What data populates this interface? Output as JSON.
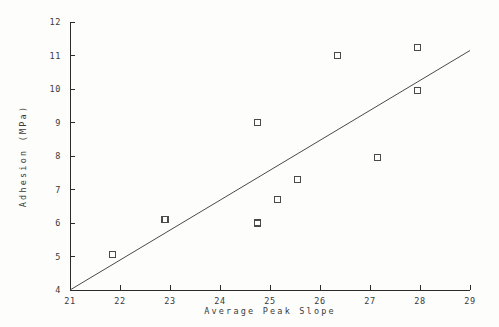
{
  "chart_data": {
    "type": "scatter",
    "title": "",
    "xlabel": "Average Peak Slope",
    "ylabel": "Adhesion (MPa)",
    "xlim": [
      21,
      29
    ],
    "ylim": [
      4,
      12
    ],
    "xticks": [
      21,
      22,
      23,
      24,
      25,
      26,
      27,
      28,
      29
    ],
    "yticks": [
      4,
      5,
      6,
      7,
      8,
      9,
      10,
      11,
      12
    ],
    "xtick_labels": [
      "21",
      "22",
      "23",
      "24",
      "25",
      "26",
      "27",
      "28",
      "29"
    ],
    "ytick_labels": [
      "4",
      "5",
      "6",
      "7",
      "8",
      "9",
      "10",
      "11",
      "12"
    ],
    "grid": false,
    "legend": null,
    "marker": "open-square",
    "points": [
      {
        "x": 21.85,
        "y": 5.05
      },
      {
        "x": 22.9,
        "y": 6.1
      },
      {
        "x": 24.75,
        "y": 9.0
      },
      {
        "x": 24.75,
        "y": 6.0
      },
      {
        "x": 25.15,
        "y": 6.7
      },
      {
        "x": 25.55,
        "y": 7.3
      },
      {
        "x": 26.35,
        "y": 11.0
      },
      {
        "x": 27.15,
        "y": 7.95
      },
      {
        "x": 27.95,
        "y": 9.95
      },
      {
        "x": 27.95,
        "y": 11.25
      }
    ],
    "series": [
      {
        "name": "Adhesion vs Average Peak Slope",
        "x": [
          21.85,
          22.9,
          24.75,
          24.75,
          25.15,
          25.55,
          26.35,
          27.15,
          27.95,
          27.95
        ],
        "values": [
          5.05,
          6.1,
          9.0,
          6.0,
          6.7,
          7.3,
          11.0,
          7.95,
          9.95,
          11.25
        ]
      }
    ],
    "fit_line": {
      "type": "line",
      "x_start": 21.0,
      "y_start": 4.0,
      "x_end": 29.0,
      "y_end": 11.15
    }
  },
  "axes": {
    "x_title": "Average Peak Slope",
    "y_title": "Adhesion (MPa)"
  }
}
